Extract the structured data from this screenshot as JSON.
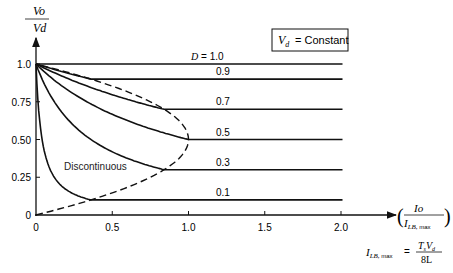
{
  "chart_data": {
    "type": "line",
    "title": "",
    "xlabel": "Io / ILB,max",
    "ylabel": "Vo / Vd",
    "xlim": [
      0,
      2.0
    ],
    "ylim": [
      0,
      1.0
    ],
    "x_ticks": [
      "0",
      "0.5",
      "1.0",
      "1.5",
      "2.0"
    ],
    "y_ticks": [
      "0",
      "0.25",
      "0.50",
      "0.75",
      "1.0"
    ],
    "grid": false,
    "annotations": {
      "constant_box": "= Constant",
      "region_label": "Discontinuous",
      "formula_lhs_main": "I",
      "formula_lhs_sub": "LB,",
      "formula_lhs_sub2": "max",
      "formula_eq": "=",
      "formula_num": "TsVd",
      "formula_den": "8L",
      "d_label_prefix": "D =",
      "x_axis_num": "Io",
      "x_axis_den_main": "I",
      "x_axis_den_sub": "LB,",
      "x_axis_den_sub2": "max",
      "y_axis_num": "Vo",
      "y_axis_den": "Vd"
    },
    "series": [
      {
        "name": "D = 1.0",
        "D": 1.0,
        "label": "1.0",
        "mode": "continuous",
        "values_note": "Vo/Vd = 1.0 for all Io"
      },
      {
        "name": "D = 0.9",
        "D": 0.9,
        "label": "0.9",
        "mode": "discontinuous then continuous",
        "boundary_x": 0.36
      },
      {
        "name": "D = 0.7",
        "D": 0.7,
        "label": "0.7",
        "mode": "discontinuous then continuous",
        "boundary_x": 0.84
      },
      {
        "name": "D = 0.5",
        "D": 0.5,
        "label": "0.5",
        "mode": "discontinuous then continuous",
        "boundary_x": 1.0
      },
      {
        "name": "D = 0.3",
        "D": 0.3,
        "label": "0.3",
        "mode": "discontinuous then continuous",
        "boundary_x": 0.84
      },
      {
        "name": "D = 0.1",
        "D": 0.1,
        "label": "0.1",
        "mode": "discontinuous then continuous",
        "boundary_x": 0.36
      }
    ],
    "boundary_curve": {
      "name": "continuous/discontinuous boundary (dashed)",
      "x": [
        0,
        0.36,
        0.64,
        0.84,
        0.96,
        1.0,
        0.96,
        0.84,
        0.64,
        0.36,
        0
      ],
      "y": [
        0,
        0.1,
        0.2,
        0.3,
        0.4,
        0.5,
        0.6,
        0.7,
        0.8,
        0.9,
        1.0
      ]
    }
  }
}
